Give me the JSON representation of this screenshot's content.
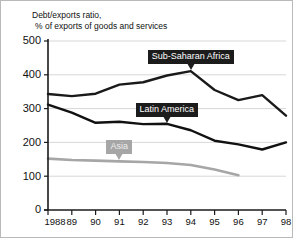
{
  "chart_data": {
    "type": "line",
    "title": "Debt/exports ratio,",
    "subtitle": "% of exports of goods and services",
    "xlabel": "",
    "ylabel": "",
    "ylim": [
      0,
      500
    ],
    "yticks": [
      0,
      100,
      200,
      300,
      400,
      500
    ],
    "grid": true,
    "legend_position": "inline-callouts",
    "x": [
      "1988",
      "89",
      "90",
      "91",
      "92",
      "93",
      "94",
      "95",
      "96",
      "97",
      "98"
    ],
    "categories": [
      "1988",
      "89",
      "90",
      "91",
      "92",
      "93",
      "94",
      "95",
      "96",
      "97",
      "98"
    ],
    "series": [
      {
        "name": "Sub-Saharan Africa",
        "color": "#1a1a1a",
        "values": [
          343,
          337,
          344,
          371,
          378,
          398,
          411,
          355,
          325,
          340,
          279
        ]
      },
      {
        "name": "Latin America",
        "color": "#111111",
        "values": [
          312,
          288,
          258,
          261,
          254,
          255,
          236,
          205,
          194,
          179,
          200
        ]
      },
      {
        "name": "Asia",
        "color": "#a6a6a6",
        "values": [
          152,
          148,
          146,
          144,
          142,
          139,
          133,
          120,
          103,
          null,
          null
        ]
      }
    ],
    "annotations": [
      {
        "label": "Sub-Saharan Africa",
        "style": "dark",
        "points_to_year": "94",
        "points_to_value": 411
      },
      {
        "label": "Latin America",
        "style": "dark",
        "points_to_year": "93",
        "points_to_value": 255
      },
      {
        "label": "Asia",
        "style": "gray",
        "points_to_year": "91",
        "points_to_value": 144
      }
    ]
  },
  "axis": {
    "ytick_labels": [
      "500",
      "400",
      "300",
      "200",
      "100",
      "0"
    ],
    "xtick_labels": [
      "1988",
      "89",
      "90",
      "91",
      "92",
      "93",
      "94",
      "95",
      "96",
      "97",
      "98"
    ]
  },
  "callouts": {
    "africa": "Sub-Saharan Africa",
    "latin": "Latin America",
    "asia": "Asia"
  }
}
